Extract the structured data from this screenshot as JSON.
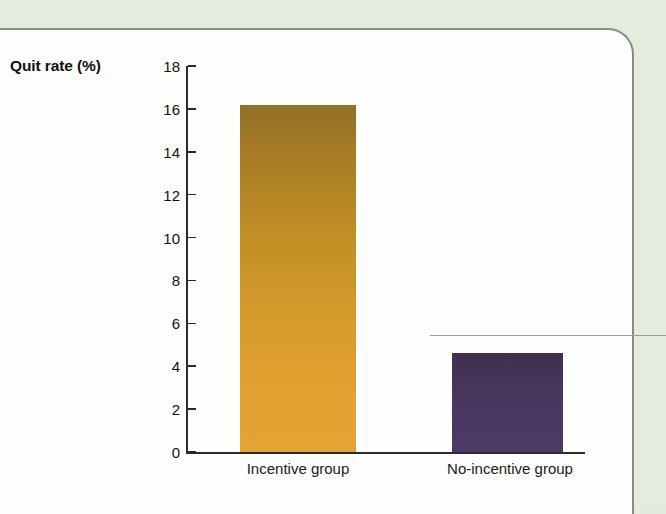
{
  "page": {
    "background_color": "#e3ecdc",
    "panel_color": "#fdfdfc",
    "panel_border_color": "#8a8a86"
  },
  "chart_data": {
    "type": "bar",
    "title": "",
    "xlabel": "",
    "ylabel": "Quit rate (%)",
    "categories": [
      "Incentive group",
      "No-incentive group"
    ],
    "values": [
      16.2,
      4.6
    ],
    "ylim": [
      0,
      18
    ],
    "yticks": [
      0,
      2,
      4,
      6,
      8,
      10,
      12,
      14,
      16,
      18
    ],
    "ytick_labels": [
      "0",
      "2",
      "4",
      "6",
      "8",
      "10",
      "12",
      "14",
      "16",
      "18"
    ],
    "grid": false,
    "legend": null,
    "series": [
      {
        "name": "Quit rate",
        "values": [
          16.2,
          4.6
        ],
        "colors": [
          "#c9912a",
          "#4a3463"
        ]
      }
    ],
    "bar_colors": {
      "incentive_top": "#91702a",
      "incentive_bottom": "#e2a433",
      "no_incentive_top": "#41304f",
      "no_incentive_bottom": "#4e3a68"
    }
  }
}
